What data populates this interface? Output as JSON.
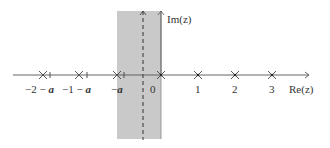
{
  "figure": {
    "axes": {
      "x_label": "Re(z)",
      "y_label": "Im(z)"
    },
    "strip": {
      "description": "shaded vertical strip between -a and 0",
      "color": "#c8c8c8"
    },
    "dashed_line_position": "-a/2",
    "poles": [
      {
        "label": "−2 − a",
        "symbol": "cross"
      },
      {
        "label": "−1 − a",
        "symbol": "cross"
      },
      {
        "label": "−a",
        "symbol": "cross"
      },
      {
        "label": "0",
        "symbol": "cross"
      },
      {
        "label": "1",
        "symbol": "cross"
      },
      {
        "label": "2",
        "symbol": "cross"
      },
      {
        "label": "3",
        "symbol": "cross"
      }
    ],
    "tick_labels": {
      "m2a_prefix": "−2 − ",
      "m1a_prefix": "−1 − ",
      "ma_prefix": "−",
      "a": "a",
      "zero": "0",
      "one": "1",
      "two": "2",
      "three": "3"
    }
  }
}
